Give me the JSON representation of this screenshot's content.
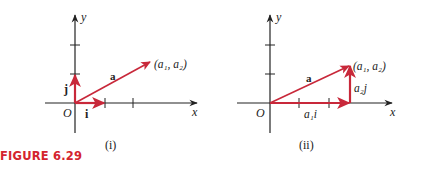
{
  "figure": {
    "caption": "FIGURE 6.29",
    "caption_color": "#d4242e",
    "vector_color": "#c8283a",
    "axis_color": "#222222"
  },
  "panels": [
    {
      "id": "i",
      "sublabel": "(i)",
      "axis_x": "x",
      "axis_y": "y",
      "origin": "O",
      "vectors": [
        {
          "name": "a",
          "label": "a"
        },
        {
          "name": "i",
          "label": "i"
        },
        {
          "name": "j",
          "label": "j"
        }
      ],
      "point_label": "(a₁, a₂)"
    },
    {
      "id": "ii",
      "sublabel": "(ii)",
      "axis_x": "x",
      "axis_y": "y",
      "origin": "O",
      "vectors": [
        {
          "name": "a",
          "label": "a"
        },
        {
          "name": "a1i",
          "label": "a₁i"
        },
        {
          "name": "a2j",
          "label": "a₂j"
        }
      ],
      "point_label": "(a₁, a₂)"
    }
  ]
}
